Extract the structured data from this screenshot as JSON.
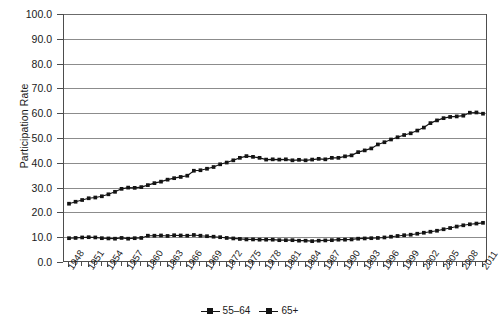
{
  "chart_data": {
    "type": "line",
    "title": "",
    "xlabel": "",
    "ylabel": "Participation Rate",
    "ylim": [
      0,
      100
    ],
    "ytick_labels": [
      "100.0",
      "90.0",
      "80.0",
      "70.0",
      "60.0",
      "50.0",
      "40.0",
      "30.0",
      "20.0",
      "10.0",
      "0.0"
    ],
    "ytick_values": [
      100,
      90,
      80,
      70,
      60,
      50,
      40,
      30,
      20,
      10,
      0
    ],
    "grid": "horizontal",
    "legend_position": "bottom-center",
    "x": [
      1948,
      1949,
      1950,
      1951,
      1952,
      1953,
      1954,
      1955,
      1956,
      1957,
      1958,
      1959,
      1960,
      1961,
      1962,
      1963,
      1964,
      1965,
      1966,
      1967,
      1968,
      1969,
      1970,
      1971,
      1972,
      1973,
      1974,
      1975,
      1976,
      1977,
      1978,
      1979,
      1980,
      1981,
      1982,
      1983,
      1984,
      1985,
      1986,
      1987,
      1988,
      1989,
      1990,
      1991,
      1992,
      1993,
      1994,
      1995,
      1996,
      1997,
      1998,
      1999,
      2000,
      2001,
      2002,
      2003,
      2004,
      2005,
      2006,
      2007,
      2008,
      2009,
      2010,
      2011
    ],
    "xtick_labels": [
      "1948",
      "1951",
      "1954",
      "1957",
      "1960",
      "1963",
      "1966",
      "1969",
      "1972",
      "1975",
      "1978",
      "1981",
      "1984",
      "1987",
      "1990",
      "1993",
      "1996",
      "1999",
      "2002",
      "2005",
      "2008",
      "2011"
    ],
    "xtick_step_years": 3,
    "series": [
      {
        "name": "55–64",
        "marker": "square",
        "color": "#141414",
        "values": [
          23.5,
          24.3,
          25.0,
          25.7,
          26.0,
          26.5,
          27.3,
          28.3,
          29.5,
          30.0,
          29.9,
          30.2,
          31.0,
          31.8,
          32.4,
          33.2,
          33.8,
          34.3,
          34.8,
          36.8,
          37.0,
          37.6,
          38.3,
          39.4,
          40.1,
          41.0,
          42.0,
          42.7,
          42.4,
          42.0,
          41.3,
          41.4,
          41.3,
          41.4,
          41.0,
          41.2,
          41.0,
          41.3,
          41.6,
          41.4,
          42.0,
          42.0,
          42.6,
          43.0,
          44.3,
          45.0,
          45.8,
          47.4,
          48.3,
          49.4,
          50.3,
          51.2,
          51.9,
          53.0,
          54.2,
          56.0,
          57.1,
          58.0,
          58.5,
          58.7,
          59.0,
          60.2,
          60.3,
          59.8
        ]
      },
      {
        "name": "65+",
        "marker": "square",
        "color": "#141414",
        "values": [
          9.6,
          9.7,
          9.9,
          10.0,
          9.9,
          9.6,
          9.5,
          9.4,
          9.7,
          9.4,
          9.6,
          9.7,
          10.6,
          10.6,
          10.7,
          10.5,
          10.8,
          10.7,
          10.6,
          10.9,
          10.6,
          10.4,
          10.2,
          10.0,
          9.7,
          9.5,
          9.3,
          9.1,
          9.1,
          9.0,
          9.0,
          9.0,
          8.8,
          8.8,
          8.8,
          8.6,
          8.6,
          8.4,
          8.6,
          8.7,
          8.8,
          9.0,
          9.0,
          9.1,
          9.4,
          9.5,
          9.6,
          9.7,
          9.9,
          10.2,
          10.5,
          10.8,
          11.0,
          11.4,
          11.8,
          12.2,
          12.6,
          13.2,
          13.7,
          14.3,
          14.8,
          15.2,
          15.5,
          15.8
        ]
      }
    ]
  },
  "legend": {
    "items": [
      {
        "label": "55–64"
      },
      {
        "label": "65+"
      }
    ]
  }
}
